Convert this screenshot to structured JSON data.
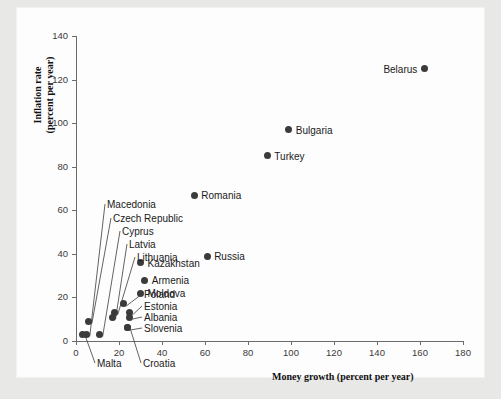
{
  "chart_data": {
    "type": "scatter",
    "title": "",
    "xlabel": "Money growth (percent per year)",
    "ylabel": "Inflation rate\n(percent per year)",
    "ylabel_line1": "Inflation rate",
    "ylabel_line2": "(percent per year)",
    "xlim": [
      0,
      180
    ],
    "ylim": [
      0,
      140
    ],
    "xticks": [
      0,
      20,
      40,
      60,
      80,
      100,
      120,
      140,
      160,
      180
    ],
    "yticks": [
      0,
      20,
      40,
      60,
      80,
      100,
      120,
      140
    ],
    "grid": false,
    "legend": "none",
    "points": [
      {
        "name": "Belarus",
        "x": 162,
        "y": 125,
        "label_side": "left"
      },
      {
        "name": "Bulgaria",
        "x": 99,
        "y": 97,
        "label_side": "right"
      },
      {
        "name": "Turkey",
        "x": 89,
        "y": 85,
        "label_side": "right"
      },
      {
        "name": "Romania",
        "x": 55,
        "y": 67,
        "label_side": "right"
      },
      {
        "name": "Russia",
        "x": 61,
        "y": 39,
        "label_side": "right"
      },
      {
        "name": "Kazakhstan",
        "x": 30,
        "y": 36,
        "label_side": "right"
      },
      {
        "name": "Armenia",
        "x": 32,
        "y": 28,
        "label_side": "right"
      },
      {
        "name": "Moldova",
        "x": 30,
        "y": 22,
        "label_side": "right"
      },
      {
        "name": "Poland",
        "x": 22,
        "y": 17,
        "label_side": "leader"
      },
      {
        "name": "Estonia",
        "x": 25,
        "y": 13,
        "label_side": "leader"
      },
      {
        "name": "Albania",
        "x": 25,
        "y": 11,
        "label_side": "leader"
      },
      {
        "name": "Slovenia",
        "x": 24,
        "y": 6,
        "label_side": "leader"
      },
      {
        "name": "Lithuania",
        "x": 18,
        "y": 13,
        "label_side": "leader"
      },
      {
        "name": "Latvia",
        "x": 17,
        "y": 11,
        "label_side": "leader"
      },
      {
        "name": "Cyprus",
        "x": 11,
        "y": 3,
        "label_side": "leader"
      },
      {
        "name": "Czech Republic",
        "x": 6,
        "y": 9,
        "label_side": "leader"
      },
      {
        "name": "Macedonia",
        "x": 5,
        "y": 3,
        "label_side": "leader"
      },
      {
        "name": "Malta",
        "x": 3,
        "y": 3,
        "label_side": "leader"
      },
      {
        "name": "Croatia",
        "x": 24,
        "y": 6,
        "label_side": "leader"
      }
    ],
    "leader_labels": [
      {
        "text": "Macedonia",
        "lx": 107,
        "ly": 208
      },
      {
        "text": "Czech Republic",
        "lx": 113,
        "ly": 222
      },
      {
        "text": "Cyprus",
        "lx": 122,
        "ly": 235
      },
      {
        "text": "Latvia",
        "lx": 129,
        "ly": 248
      },
      {
        "text": "Lithuania",
        "lx": 137,
        "ly": 261
      },
      {
        "text": "Poland",
        "lx": 144,
        "ly": 298
      },
      {
        "text": "Estonia",
        "lx": 144,
        "ly": 310
      },
      {
        "text": "Albania",
        "lx": 144,
        "ly": 321
      },
      {
        "text": "Slovenia",
        "lx": 144,
        "ly": 332
      },
      {
        "text": "Malta",
        "lx": 97,
        "ly": 367
      },
      {
        "text": "Croatia",
        "lx": 143,
        "ly": 367
      }
    ],
    "colors": {
      "marker": "#3b3b3b",
      "axis": "#6b6b6b",
      "text": "#1a1a1a",
      "page": "#fdfdfd",
      "backdrop": "#e8e8e6"
    }
  }
}
